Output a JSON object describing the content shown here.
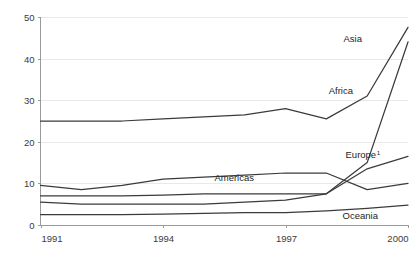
{
  "chart_data": {
    "type": "line",
    "title": "",
    "subtitle": "",
    "xlabel": "",
    "ylabel": "",
    "x": [
      1991,
      1992,
      1993,
      1994,
      1995,
      1996,
      1997,
      1998,
      1999,
      2000
    ],
    "xlim": [
      1991,
      2000
    ],
    "ylim": [
      0,
      50
    ],
    "xticks": [
      1991,
      1994,
      1997,
      2000
    ],
    "xtick_labels": [
      "1991",
      "1994",
      "1997",
      "2000"
    ],
    "yticks": [
      0,
      10,
      20,
      30,
      40,
      50
    ],
    "ytick_labels": [
      "0",
      "10",
      "20",
      "30",
      "40",
      "50"
    ],
    "grid": "horizontal",
    "legend": "inline-end-labels",
    "line_color": "#3b3b3b",
    "axis_color": "#9a9a9a",
    "grid_color": "#e3e3e3",
    "series": [
      {
        "name": "Asia",
        "label": "Asia",
        "label_superscript": "",
        "values": [
          25.0,
          25.0,
          25.0,
          25.5,
          26.0,
          26.5,
          28.0,
          25.5,
          31.0,
          47.5
        ]
      },
      {
        "name": "Africa",
        "label": "Africa",
        "label_superscript": "",
        "values": [
          5.5,
          5.0,
          5.0,
          5.0,
          5.0,
          5.5,
          6.0,
          7.5,
          15.0,
          44.0
        ]
      },
      {
        "name": "Europe",
        "label": "Europe",
        "label_superscript": "1",
        "values": [
          7.0,
          7.0,
          7.0,
          7.2,
          7.5,
          7.5,
          7.5,
          7.5,
          13.5,
          16.5
        ]
      },
      {
        "name": "Americas",
        "label": "Americas",
        "label_superscript": "",
        "values": [
          9.5,
          8.5,
          9.5,
          11.0,
          11.5,
          12.0,
          12.5,
          12.5,
          8.5,
          10.0
        ]
      },
      {
        "name": "Oceania",
        "label": "Oceania",
        "label_superscript": "",
        "values": [
          2.5,
          2.5,
          2.5,
          2.6,
          2.8,
          3.0,
          3.0,
          3.4,
          4.0,
          4.8
        ]
      }
    ],
    "annotations": [
      {
        "text": "Asia",
        "superscript": "",
        "x": 362,
        "y": 42
      },
      {
        "text": "Africa",
        "superscript": "",
        "x": 353,
        "y": 94
      },
      {
        "text": "Europe",
        "superscript": "1",
        "x": 380,
        "y": 158
      },
      {
        "text": "Americas",
        "superscript": "",
        "x": 254,
        "y": 181
      },
      {
        "text": "Oceania",
        "superscript": "",
        "x": 378,
        "y": 219
      }
    ]
  }
}
